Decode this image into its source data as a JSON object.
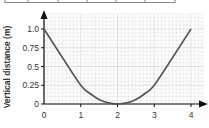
{
  "table_strip": {
    "visible": true,
    "dividers_x": [
      5,
      28,
      58,
      87,
      116,
      145,
      175
    ]
  },
  "colors": {
    "curve": "#555555",
    "axis": "#111111",
    "grid_minor": "#e6e6e6",
    "grid_major": "#cccccc",
    "text": "#333333",
    "table_border": "#888888"
  },
  "chart_data": {
    "type": "line",
    "title": "",
    "xlabel": "",
    "ylabel": "Vertical distance (m)",
    "x_ticks": [
      "0",
      "1",
      "2",
      "3",
      "4"
    ],
    "y_ticks": [
      "0",
      "0.25",
      "0.5",
      "0.75",
      "1.0"
    ],
    "xlim": [
      0,
      4.4
    ],
    "ylim": [
      0,
      1.2
    ],
    "grid": true,
    "legend": null,
    "series": [
      {
        "name": "curve",
        "x": [
          0,
          0.5,
          1,
          1.25,
          1.5,
          1.75,
          2,
          2.25,
          2.5,
          2.75,
          3,
          3.5,
          4
        ],
        "y": [
          1.0,
          0.62,
          0.25,
          0.14,
          0.06,
          0.015,
          0,
          0.015,
          0.06,
          0.14,
          0.25,
          0.62,
          1.0
        ]
      }
    ]
  }
}
